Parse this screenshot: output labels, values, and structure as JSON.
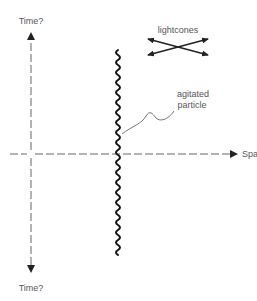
{
  "diagram": {
    "axes": {
      "time_top_label": "Time?",
      "time_bottom_label": "Time?",
      "space_label": "Space"
    },
    "annotations": {
      "lightcones_label": "lightcones",
      "particle_label_line1": "agitated",
      "particle_label_line2": "particle"
    },
    "colors": {
      "background": "#ffffff",
      "axis": "#555555",
      "particle": "#111111",
      "text": "#555555"
    }
  }
}
